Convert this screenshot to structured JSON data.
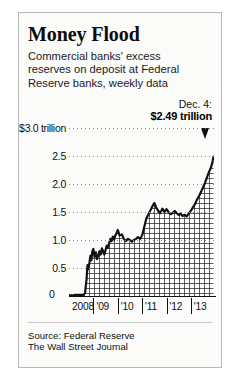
{
  "card": {
    "title": "Money Flood",
    "subtitle": "Commercial banks' excess reserves on deposit at Federal Reserve banks, weekly data",
    "source_line_1": "Source: Federal Reserve",
    "source_line_2": "The Wall Street Journal",
    "border_color": "#b9b9b9",
    "background_color": "#fbfbfa"
  },
  "callout": {
    "date_label": "Dec. 4:",
    "value_label": "$2.49 trillion",
    "pointer_icon": "down-triangle-marker"
  },
  "chart_data": {
    "type": "area",
    "title": "Money Flood",
    "subtitle": "Commercial banks' excess reserves on deposit at Federal Reserve banks, weekly data",
    "xlabel": "",
    "ylabel": "",
    "ylim": [
      0,
      3.0
    ],
    "xlim": [
      2008,
      2013.95
    ],
    "grid": true,
    "legend": false,
    "units": "trillions of dollars",
    "fill_style": "crosshatch",
    "line_color": "#111111",
    "ytick_labels": [
      "$3.0 trillion",
      "2.5",
      "2.0",
      "1.5",
      "1.0",
      "0.5",
      "0"
    ],
    "ytick_values": [
      3.0,
      2.5,
      2.0,
      1.5,
      1.0,
      0.5,
      0
    ],
    "xtick_labels": [
      "2008",
      "'09",
      "'10",
      "'11",
      "'12",
      "'13"
    ],
    "xtick_values": [
      2008,
      2009,
      2010,
      2011,
      2012,
      2013
    ],
    "annotations": [
      {
        "label": "Dec. 4:",
        "value_label": "$2.49 trillion",
        "x": 2013.93,
        "y": 2.49
      }
    ],
    "series": [
      {
        "name": "Excess reserves",
        "x": [
          2008.0,
          2008.08,
          2008.17,
          2008.25,
          2008.33,
          2008.42,
          2008.5,
          2008.58,
          2008.66,
          2008.72,
          2008.76,
          2008.8,
          2008.84,
          2008.88,
          2008.92,
          2008.96,
          2009.0,
          2009.05,
          2009.1,
          2009.15,
          2009.2,
          2009.25,
          2009.3,
          2009.35,
          2009.4,
          2009.45,
          2009.5,
          2009.55,
          2009.6,
          2009.65,
          2009.7,
          2009.75,
          2009.8,
          2009.85,
          2009.9,
          2009.95,
          2010.0,
          2010.08,
          2010.17,
          2010.25,
          2010.33,
          2010.42,
          2010.5,
          2010.58,
          2010.66,
          2010.75,
          2010.83,
          2010.92,
          2011.0,
          2011.08,
          2011.17,
          2011.25,
          2011.33,
          2011.42,
          2011.5,
          2011.58,
          2011.66,
          2011.75,
          2011.83,
          2011.92,
          2012.0,
          2012.08,
          2012.17,
          2012.25,
          2012.33,
          2012.42,
          2012.5,
          2012.58,
          2012.66,
          2012.75,
          2012.83,
          2012.92,
          2013.0,
          2013.08,
          2013.17,
          2013.25,
          2013.33,
          2013.42,
          2013.5,
          2013.58,
          2013.66,
          2013.75,
          2013.83,
          2013.9,
          2013.93
        ],
        "values": [
          0.01,
          0.01,
          0.01,
          0.02,
          0.02,
          0.02,
          0.02,
          0.02,
          0.05,
          0.3,
          0.55,
          0.48,
          0.6,
          0.72,
          0.64,
          0.8,
          0.84,
          0.7,
          0.78,
          0.66,
          0.72,
          0.8,
          0.74,
          0.85,
          0.8,
          0.74,
          0.82,
          0.9,
          0.86,
          0.95,
          1.02,
          0.98,
          1.06,
          1.0,
          1.08,
          1.12,
          1.18,
          1.08,
          1.1,
          1.02,
          0.98,
          1.02,
          1.0,
          0.97,
          1.0,
          1.02,
          1.05,
          1.02,
          1.08,
          1.22,
          1.38,
          1.45,
          1.52,
          1.6,
          1.66,
          1.58,
          1.52,
          1.48,
          1.56,
          1.5,
          1.55,
          1.5,
          1.46,
          1.48,
          1.52,
          1.48,
          1.45,
          1.47,
          1.43,
          1.45,
          1.42,
          1.48,
          1.52,
          1.58,
          1.64,
          1.72,
          1.78,
          1.86,
          1.94,
          2.02,
          2.12,
          2.22,
          2.3,
          2.42,
          2.49
        ]
      }
    ]
  }
}
